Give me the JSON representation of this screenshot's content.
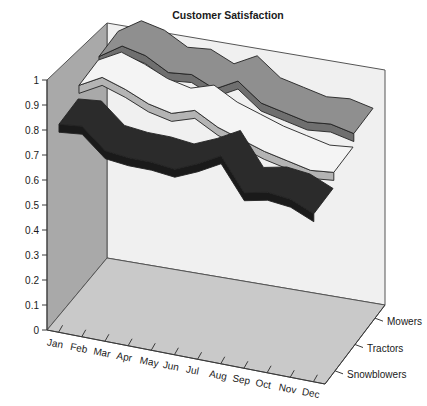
{
  "chart_data": {
    "type": "line",
    "render": "3d-ribbon",
    "title": "Customer Satisfaction",
    "xlabel": "",
    "ylabel": "",
    "zlabel": "",
    "grid": false,
    "legend_position": "right-axis-labels",
    "categories": [
      "Jan",
      "Feb",
      "Mar",
      "Apr",
      "May",
      "Jun",
      "Jul",
      "Aug",
      "Sep",
      "Oct",
      "Nov",
      "Dec"
    ],
    "ylim": [
      0,
      1
    ],
    "ytick_labels": [
      "0",
      "0.1",
      "0.2",
      "0.3",
      "0.4",
      "0.5",
      "0.6",
      "0.7",
      "0.8",
      "0.9",
      "1"
    ],
    "ytick_values": [
      0,
      0.1,
      0.2,
      0.3,
      0.4,
      0.5,
      0.6,
      0.7,
      0.8,
      0.9,
      1
    ],
    "series": [
      {
        "name": "Mowers",
        "color": "#8f8f8f",
        "side_color": "#6f6f6f",
        "values": [
          0.89,
          0.95,
          0.93,
          0.88,
          0.89,
          0.85,
          0.9,
          0.83,
          0.81,
          0.79,
          0.8,
          0.78
        ]
      },
      {
        "name": "Tractors",
        "color": "#f4f4f4",
        "side_color": "#b4b4b4",
        "values": [
          0.88,
          0.93,
          0.9,
          0.86,
          0.84,
          0.87,
          0.82,
          0.79,
          0.76,
          0.74,
          0.72,
          0.73
        ]
      },
      {
        "name": "Snowblowers",
        "color": "#2b2b2b",
        "side_color": "#1a1a1a",
        "values": [
          0.83,
          0.84,
          0.76,
          0.75,
          0.75,
          0.74,
          0.78,
          0.83,
          0.7,
          0.72,
          0.71,
          0.67
        ]
      }
    ]
  },
  "panels": {
    "back_wall_color": "#f0f0f0",
    "left_wall_color": "#a9a9a9",
    "floor_color": "#c9c9c9"
  }
}
